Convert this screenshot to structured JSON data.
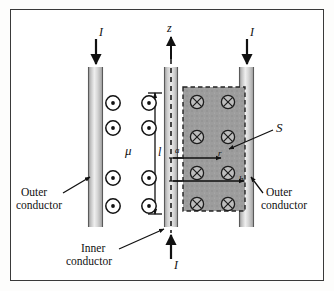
{
  "figure": {
    "type": "physics-diagram",
    "background_color": "#ffffff",
    "frame_color": "#3a3a3a"
  },
  "labels": {
    "current_top_left": "I",
    "current_top_right": "I",
    "current_bottom": "I",
    "axis_z": "z",
    "permeability": "μ",
    "length": "l",
    "inner_radius": "a",
    "outer_radius": "b",
    "radius_variable": "r",
    "surface": "S",
    "outer_conductor_left_line1": "Outer",
    "outer_conductor_left_line2": "conductor",
    "outer_conductor_right_line1": "Outer",
    "outer_conductor_right_line2": "conductor",
    "inner_conductor_line1": "Inner",
    "inner_conductor_line2": "conductor"
  },
  "colors": {
    "conductor_fill": "#c9c9c9",
    "conductor_edge": "#6f6f6f",
    "conductor_highlight": "#f2f2f2",
    "surface_fill": "#9a9a9a",
    "surface_border": "#2b2b2b",
    "line_color": "#111111",
    "symbol_stroke": "#111111"
  },
  "field_symbols": {
    "out_of_page": {
      "glyph": "dot-in-circle",
      "meaning": "magnetic field out of page",
      "count": 8,
      "rows": 4,
      "columns": 2,
      "positions": [
        [
          112,
          102
        ],
        [
          148,
          102
        ],
        [
          112,
          127
        ],
        [
          148,
          127
        ],
        [
          112,
          177
        ],
        [
          148,
          177
        ],
        [
          112,
          205
        ],
        [
          148,
          205
        ]
      ]
    },
    "into_page": {
      "glyph": "cross-in-circle",
      "meaning": "magnetic field into page",
      "count": 8,
      "rows": 4,
      "columns": 2,
      "positions": [
        [
          196,
          101
        ],
        [
          227,
          101
        ],
        [
          196,
          136
        ],
        [
          227,
          136
        ],
        [
          196,
          172
        ],
        [
          227,
          172
        ],
        [
          196,
          203
        ],
        [
          227,
          203
        ]
      ]
    }
  },
  "geometry": {
    "outer_conductor_left": {
      "x": 87,
      "y": 66,
      "width": 15,
      "height": 160
    },
    "outer_conductor_right": {
      "x": 238,
      "y": 66,
      "width": 15,
      "height": 160
    },
    "inner_conductor": {
      "x": 163,
      "y": 66,
      "width": 14,
      "height": 160
    },
    "surface_region": {
      "x": 182,
      "y": 86,
      "width": 62,
      "height": 124
    },
    "z_axis": {
      "x": 170,
      "y_top": 38,
      "y_bottom": 232
    }
  },
  "arrows": {
    "current_top_left": {
      "from": [
        97,
        38
      ],
      "to": [
        97,
        63
      ],
      "direction": "down"
    },
    "current_top_right": {
      "from": [
        246,
        38
      ],
      "to": [
        246,
        63
      ],
      "direction": "down"
    },
    "current_bottom": {
      "from": [
        170,
        258
      ],
      "to": [
        170,
        234
      ],
      "direction": "up"
    },
    "z_axis": {
      "from": [
        170,
        58
      ],
      "to": [
        170,
        36
      ],
      "direction": "up"
    },
    "radius_r": {
      "from": [
        172,
        157
      ],
      "to": [
        222,
        157
      ],
      "direction": "right"
    },
    "radius_b": {
      "from": [
        172,
        180
      ],
      "to": [
        243,
        180
      ],
      "direction": "right"
    },
    "length_dimension": {
      "x": 154,
      "y_top": 92,
      "y_bottom": 213,
      "both_ends": true
    },
    "surface_leader": {
      "from": [
        272,
        129
      ],
      "to": [
        228,
        147
      ]
    },
    "outer_left_leader": {
      "from": [
        62,
        192
      ],
      "to": [
        89,
        176
      ]
    },
    "outer_right_leader": {
      "from": [
        262,
        176
      ],
      "to": [
        250,
        192
      ]
    },
    "inner_leader": {
      "from": [
        118,
        248
      ],
      "to": [
        163,
        228
      ]
    }
  }
}
